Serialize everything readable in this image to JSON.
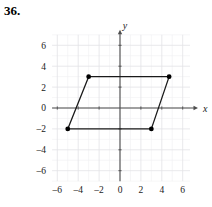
{
  "problem": {
    "number": "36."
  },
  "chart_data": {
    "type": "scatter",
    "title": "",
    "xlabel": "x",
    "ylabel": "y",
    "xlim": [
      -7,
      7
    ],
    "ylim": [
      -7,
      7
    ],
    "grid": true,
    "grid_step": 1,
    "major_step": 2,
    "legend": "none",
    "x_ticks": [
      -6,
      -4,
      -2,
      0,
      2,
      4,
      6
    ],
    "x_tick_labels": [
      "–6",
      "–4",
      "–2",
      "0",
      "2",
      "4",
      "6"
    ],
    "y_ticks": [
      6,
      4,
      2,
      0,
      -2,
      -4,
      -6
    ],
    "y_tick_labels": [
      "6",
      "4",
      "2",
      "0",
      "–2",
      "–4",
      "–6"
    ],
    "shape": "parallelogram",
    "vertices": [
      {
        "label": "top-left",
        "x": -3,
        "y": 3
      },
      {
        "label": "top-right",
        "x": 4.7,
        "y": 3
      },
      {
        "label": "bottom-right",
        "x": 3,
        "y": -2
      },
      {
        "label": "bottom-left",
        "x": -5,
        "y": -2
      }
    ],
    "edges": [
      {
        "from": 0,
        "to": 1
      },
      {
        "from": 1,
        "to": 2
      },
      {
        "from": 2,
        "to": 3
      },
      {
        "from": 3,
        "to": 0
      }
    ],
    "marker": "filled-circle",
    "marker_color": "#000000",
    "line_color": "#1a1a1a",
    "axis_color": "#4d4d4d",
    "grid_color": "#e2e2e6",
    "grid_minor_color": "#f0f0f2"
  }
}
